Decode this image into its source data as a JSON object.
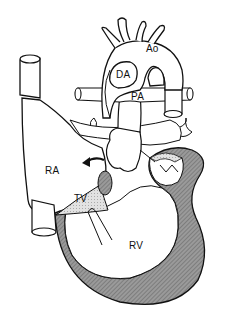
{
  "diagram": {
    "labels": {
      "ao": "Ao",
      "da": "DA",
      "pa": "PA",
      "ra": "RA",
      "tv": "TV",
      "rv": "RV"
    },
    "colors": {
      "outline": "#111111",
      "wall_fill": "#8c8c8c",
      "valve_fill": "#d8d8d8",
      "background": "#ffffff"
    }
  }
}
